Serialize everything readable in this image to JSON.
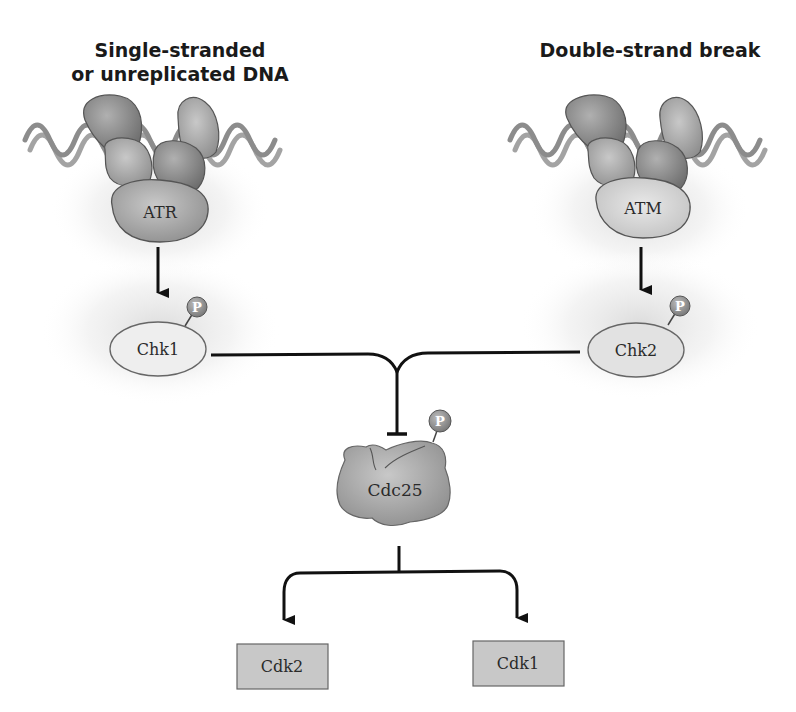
{
  "titles": {
    "left_line1": "Single-stranded",
    "left_line2": "or unreplicated DNA",
    "right": "Double-strand break"
  },
  "nodes": {
    "atr": "ATR",
    "atm": "ATM",
    "chk1": "Chk1",
    "chk2": "Chk2",
    "cdc25": "Cdc25",
    "cdk2": "Cdk2",
    "cdk1": "Cdk1",
    "phospho": "P"
  },
  "edges": [
    {
      "from": "ATR",
      "to": "Chk1",
      "type": "activation"
    },
    {
      "from": "ATM",
      "to": "Chk2",
      "type": "activation"
    },
    {
      "from": "Chk1",
      "to": "Cdc25",
      "type": "inhibition"
    },
    {
      "from": "Chk2",
      "to": "Cdc25",
      "type": "inhibition"
    },
    {
      "from": "Cdc25",
      "to": "Cdk2",
      "type": "activation"
    },
    {
      "from": "Cdc25",
      "to": "Cdk1",
      "type": "activation"
    }
  ],
  "colors": {
    "dna": "#8c8c8c",
    "protein_dark": "#8a8a8a",
    "protein_mid": "#a8a8a8",
    "protein_light": "#d6d6d6",
    "kinase_box": "#c8c8c8",
    "phospho": "#9a9a9a",
    "line": "#111111"
  }
}
